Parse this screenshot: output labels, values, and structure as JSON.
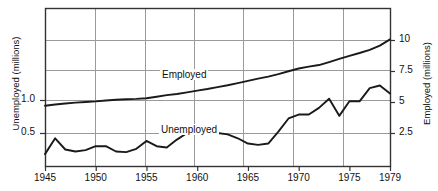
{
  "chart_data": {
    "type": "line",
    "title": "",
    "subtitle": "",
    "xlabel": "",
    "ylabel_left": "Unemployed (millions)",
    "ylabel_right": "Employed (millions)",
    "grid": true,
    "legend_position": "inline-annotation",
    "x": [
      1945,
      1946,
      1947,
      1948,
      1949,
      1950,
      1951,
      1952,
      1953,
      1954,
      1955,
      1956,
      1957,
      1958,
      1959,
      1960,
      1961,
      1962,
      1963,
      1964,
      1965,
      1966,
      1967,
      1968,
      1969,
      1970,
      1971,
      1972,
      1973,
      1974,
      1975,
      1976,
      1977,
      1978,
      1979
    ],
    "xlim": [
      1945,
      1979
    ],
    "xticks": [
      1945,
      1950,
      1955,
      1960,
      1965,
      1970,
      1975,
      1979
    ],
    "xticklabels": [
      "1945",
      "1950",
      "1955",
      "1960",
      "1965",
      "1970",
      "1975",
      "1979"
    ],
    "left_axis": {
      "label": "Unemployed (millions)",
      "ticks": [
        0.5,
        1.0
      ],
      "ticklabels": [
        "0.5",
        "1.0"
      ],
      "lim": [
        0.0,
        2.0
      ]
    },
    "right_axis": {
      "label": "Employed (millions)",
      "ticks": [
        2.5,
        5,
        7.5,
        10
      ],
      "ticklabels": [
        "2.5",
        "7.5",
        "5",
        "10"
      ],
      "lim": [
        0,
        12.5
      ]
    },
    "series": [
      {
        "name": "Employed",
        "axis": "right",
        "annotation": "Employed",
        "units": "millions",
        "values": [
          4.7,
          4.8,
          4.88,
          4.95,
          5.0,
          5.05,
          5.12,
          5.18,
          5.22,
          5.25,
          5.3,
          5.42,
          5.55,
          5.65,
          5.78,
          5.92,
          6.05,
          6.2,
          6.35,
          6.52,
          6.7,
          6.88,
          7.05,
          7.25,
          7.48,
          7.7,
          7.85,
          7.98,
          8.22,
          8.48,
          8.72,
          8.95,
          9.2,
          9.55,
          10.05
        ]
      },
      {
        "name": "Unemployed",
        "axis": "left",
        "annotation": "Unemployed",
        "units": "millions",
        "values": [
          0.18,
          0.42,
          0.25,
          0.22,
          0.24,
          0.3,
          0.3,
          0.22,
          0.21,
          0.26,
          0.38,
          0.3,
          0.28,
          0.4,
          0.5,
          0.5,
          0.5,
          0.5,
          0.48,
          0.42,
          0.34,
          0.32,
          0.34,
          0.52,
          0.72,
          0.78,
          0.78,
          0.88,
          1.02,
          0.76,
          0.98,
          0.98,
          1.18,
          1.22,
          1.1
        ]
      }
    ],
    "annotations": [
      {
        "text": "Employed",
        "x": 1955.5,
        "y_px": 76
      },
      {
        "text": "Unemployed",
        "x": 1955.8,
        "y_px": 131
      }
    ]
  },
  "geometry": {
    "plot_left": 45,
    "plot_right": 390,
    "plot_top": 8,
    "plot_bottom": 166,
    "hgrid_y": [
      40,
      70,
      100,
      133
    ],
    "vgrid_x": [
      95,
      145,
      194,
      243,
      293,
      343
    ]
  },
  "style": {
    "line_color": "#1a1a1a",
    "grid_color": "#9a9a9a",
    "frame_color": "#333333",
    "background": "#ffffff"
  }
}
